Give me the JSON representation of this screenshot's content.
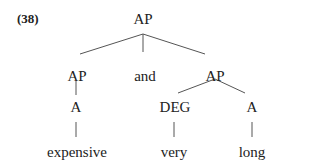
{
  "example_number": "(38)",
  "tree": {
    "root": "AP",
    "children": [
      {
        "label": "AP",
        "child": "A",
        "word": "expensive"
      },
      {
        "label": "and"
      },
      {
        "label": "AP",
        "children": [
          {
            "label": "DEG",
            "word": "very"
          },
          {
            "label": "A",
            "word": "long"
          }
        ]
      }
    ]
  },
  "nodes": {
    "root": "AP",
    "ap_left": "AP",
    "conj": "and",
    "ap_right": "AP",
    "a_left": "A",
    "deg": "DEG",
    "a_right": "A",
    "w_expensive": "expensive",
    "w_very": "very",
    "w_long": "long"
  },
  "colors": {
    "line": "#444444",
    "text": "#222222"
  }
}
